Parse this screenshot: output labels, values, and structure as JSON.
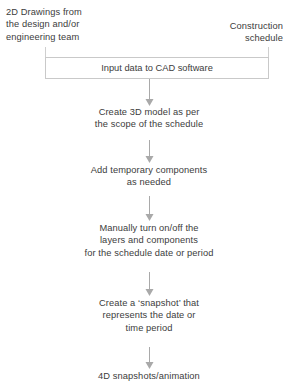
{
  "diagram": {
    "colors": {
      "text": "#3c3c3c",
      "line": "#a9a9a9",
      "line_faint": "#cfcfcf",
      "box_border": "#c9c9c9",
      "background": "#ffffff"
    },
    "inputs": [
      {
        "id": "input-drawings",
        "label": "2D Drawings from\nthe design and/or\nengineering team",
        "align": "left"
      },
      {
        "id": "input-schedule",
        "label": "Construction\nschedule",
        "align": "right"
      }
    ],
    "steps": [
      {
        "id": "step-input-cad",
        "label": "Input data to CAD software",
        "shape": "box"
      },
      {
        "id": "step-create-3d-model",
        "label": "Create 3D model as per\nthe scope of the schedule",
        "shape": "text"
      },
      {
        "id": "step-add-temporary-components",
        "label": "Add temporary components\nas needed",
        "shape": "text"
      },
      {
        "id": "step-toggle-layers",
        "label": "Manually turn on/off the\nlayers and components\nfor the schedule date or period",
        "shape": "text"
      },
      {
        "id": "step-create-snapshot",
        "label": "Create a ‘snapshot’ that\nrepresents the date or\ntime period",
        "shape": "text"
      },
      {
        "id": "output-4d-snapshots",
        "label": "4D snapshots/animation",
        "shape": "text"
      }
    ]
  }
}
